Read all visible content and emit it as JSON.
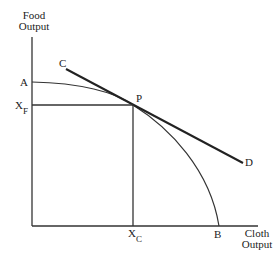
{
  "diagram": {
    "type": "production-possibility-frontier",
    "y_axis_label_line1": "Food",
    "y_axis_label_line2": "Output",
    "x_axis_label_line1": "Cloth",
    "x_axis_label_line2": "Output",
    "points": {
      "A": "A",
      "B": "B",
      "C": "C",
      "D": "D",
      "P": "P",
      "XF_main": "X",
      "XF_sub": "F",
      "XC_main": "X",
      "XC_sub": "C"
    },
    "colors": {
      "line": "#222222",
      "background": "#ffffff"
    }
  }
}
